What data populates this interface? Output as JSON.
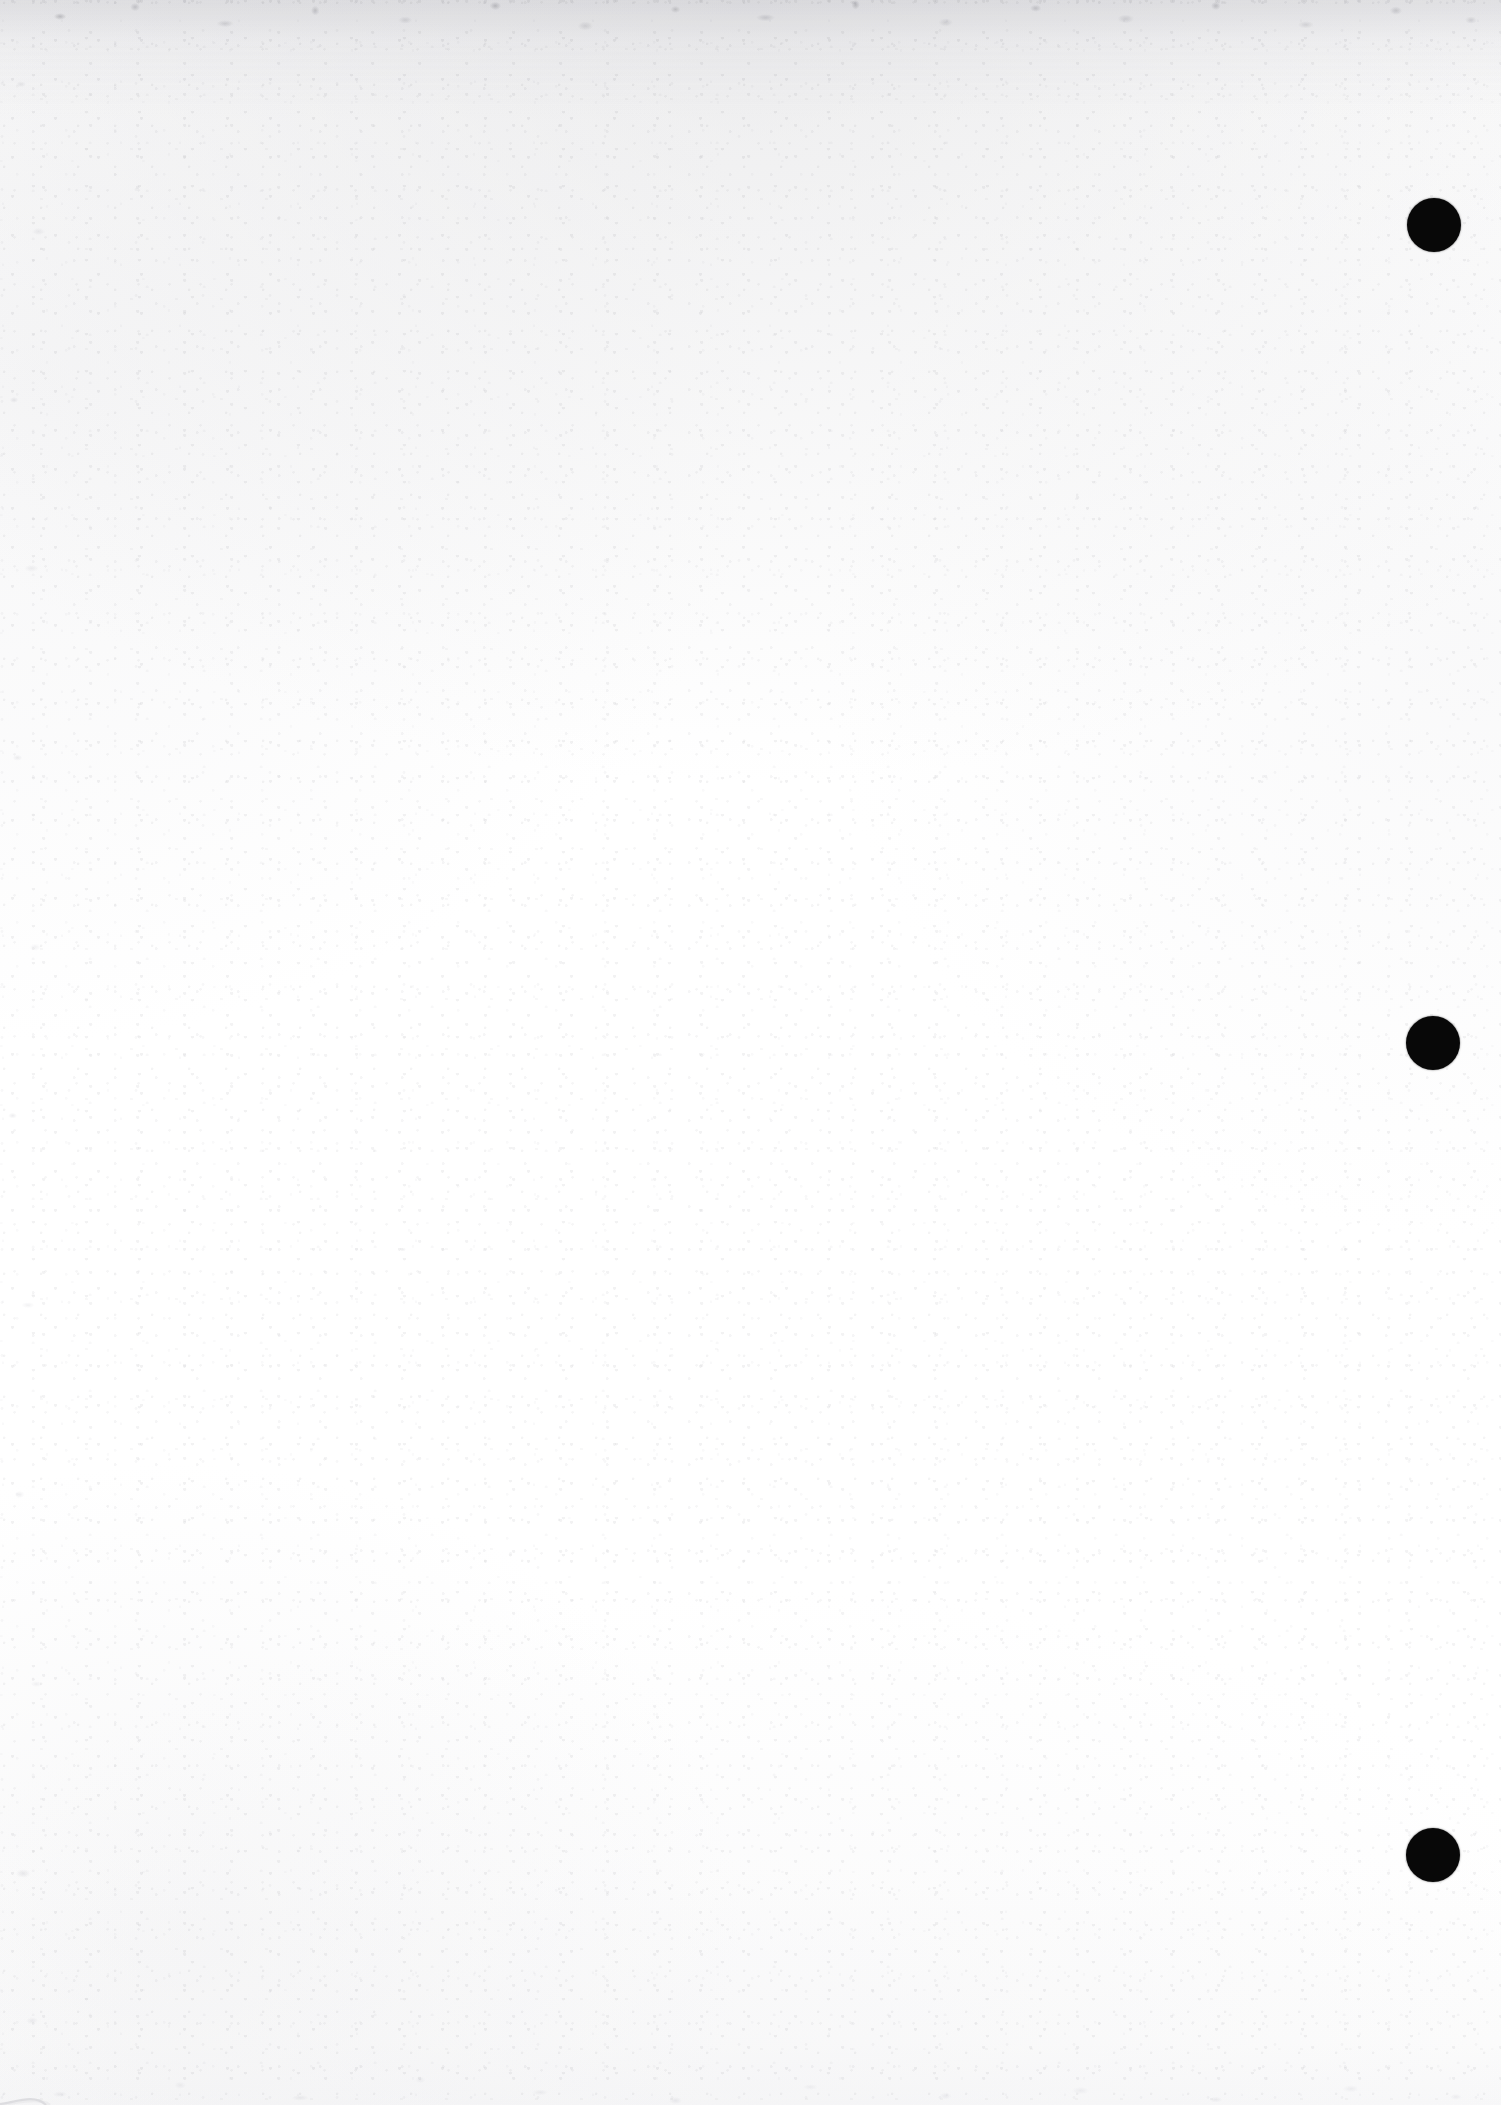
{
  "page": {
    "kind": "scanned-blank-page",
    "width": 1501,
    "height": 2105,
    "background_color": "#ffffff",
    "paper_tone": "#fdfdfd",
    "body_text": "",
    "caption": ""
  },
  "marks": {
    "ink_color": "#080808",
    "group_label": "registration-dots",
    "dots": [
      {
        "id": "dot-1",
        "label": "1",
        "cx": 1434,
        "cy": 225,
        "d": 54
      },
      {
        "id": "dot-2",
        "label": "2",
        "cx": 1433,
        "cy": 1043,
        "d": 54
      },
      {
        "id": "dot-3",
        "label": "3",
        "cx": 1433,
        "cy": 1855,
        "d": 54
      }
    ]
  },
  "artifacts": {
    "top_edge_noise": "scanner-grain-band",
    "left_edge_noise": "scanner-speckle",
    "bottom_edge_noise": "scanner-speckle",
    "corner_curl": "page-curl-arc",
    "curl_color": "#c9c9cd"
  }
}
